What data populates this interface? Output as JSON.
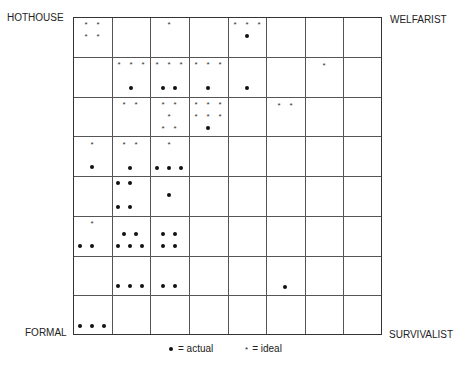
{
  "corners": {
    "top_left": "HOTHOUSE",
    "top_right": "WELFARIST",
    "bottom_left": "FORMAL",
    "bottom_right": "SURVIVALIST"
  },
  "legend": {
    "actual_symbol": "•",
    "actual_label": "= actual",
    "ideal_symbol": "*",
    "ideal_label": "= ideal"
  },
  "grid": {
    "rows": 8,
    "cols": 8,
    "cells": [
      {
        "row": 0,
        "col": 0,
        "ideal": 4,
        "actual": 0
      },
      {
        "row": 0,
        "col": 2,
        "ideal": 1,
        "actual": 0
      },
      {
        "row": 0,
        "col": 4,
        "ideal": 3,
        "actual": 1
      },
      {
        "row": 1,
        "col": 1,
        "ideal": 3,
        "actual": 1
      },
      {
        "row": 1,
        "col": 2,
        "ideal": 3,
        "actual": 2
      },
      {
        "row": 1,
        "col": 3,
        "ideal": 3,
        "actual": 0
      },
      {
        "row": 1,
        "col": 4,
        "ideal": 0,
        "actual": 1
      },
      {
        "row": 1,
        "col": 6,
        "ideal": 1,
        "actual": 0
      },
      {
        "row": 2,
        "col": 1,
        "ideal": 2,
        "actual": 0
      },
      {
        "row": 2,
        "col": 2,
        "ideal": 5,
        "actual": 0
      },
      {
        "row": 2,
        "col": 3,
        "ideal": 6,
        "actual": 1
      },
      {
        "row": 2,
        "col": 5,
        "ideal": 2,
        "actual": 0
      },
      {
        "row": 3,
        "col": 0,
        "ideal": 1,
        "actual": 1
      },
      {
        "row": 3,
        "col": 1,
        "ideal": 2,
        "actual": 1
      },
      {
        "row": 3,
        "col": 2,
        "ideal": 1,
        "actual": 3
      },
      {
        "row": 4,
        "col": 1,
        "ideal": 0,
        "actual": 4
      },
      {
        "row": 4,
        "col": 2,
        "ideal": 0,
        "actual": 1
      },
      {
        "row": 5,
        "col": 0,
        "ideal": 1,
        "actual": 2
      },
      {
        "row": 5,
        "col": 1,
        "ideal": 0,
        "actual": 5
      },
      {
        "row": 5,
        "col": 2,
        "ideal": 0,
        "actual": 4
      },
      {
        "row": 6,
        "col": 1,
        "ideal": 0,
        "actual": 3
      },
      {
        "row": 6,
        "col": 2,
        "ideal": 0,
        "actual": 2
      },
      {
        "row": 6,
        "col": 5,
        "ideal": 0,
        "actual": 1
      },
      {
        "row": 7,
        "col": 0,
        "ideal": 0,
        "actual": 3
      }
    ]
  },
  "marks": [
    {
      "t": "star",
      "x": 86,
      "y": 23
    },
    {
      "t": "star",
      "x": 98,
      "y": 23
    },
    {
      "t": "star",
      "x": 86,
      "y": 35
    },
    {
      "t": "star",
      "x": 98,
      "y": 35
    },
    {
      "t": "star",
      "x": 169,
      "y": 23
    },
    {
      "t": "star",
      "x": 235,
      "y": 23
    },
    {
      "t": "star",
      "x": 247,
      "y": 23
    },
    {
      "t": "star",
      "x": 259,
      "y": 23
    },
    {
      "t": "dot",
      "x": 247,
      "y": 36
    },
    {
      "t": "star",
      "x": 119,
      "y": 63
    },
    {
      "t": "star",
      "x": 131,
      "y": 63
    },
    {
      "t": "star",
      "x": 143,
      "y": 63
    },
    {
      "t": "dot",
      "x": 131,
      "y": 88
    },
    {
      "t": "star",
      "x": 157,
      "y": 63
    },
    {
      "t": "star",
      "x": 169,
      "y": 63
    },
    {
      "t": "star",
      "x": 181,
      "y": 63
    },
    {
      "t": "dot",
      "x": 163,
      "y": 88
    },
    {
      "t": "dot",
      "x": 175,
      "y": 88
    },
    {
      "t": "star",
      "x": 196,
      "y": 63
    },
    {
      "t": "star",
      "x": 208,
      "y": 63
    },
    {
      "t": "star",
      "x": 220,
      "y": 63
    },
    {
      "t": "dot",
      "x": 208,
      "y": 88
    },
    {
      "t": "dot",
      "x": 247,
      "y": 88
    },
    {
      "t": "star",
      "x": 324,
      "y": 64
    },
    {
      "t": "star",
      "x": 124,
      "y": 103
    },
    {
      "t": "star",
      "x": 136,
      "y": 103
    },
    {
      "t": "star",
      "x": 163,
      "y": 103
    },
    {
      "t": "star",
      "x": 175,
      "y": 103
    },
    {
      "t": "star",
      "x": 169,
      "y": 115
    },
    {
      "t": "star",
      "x": 163,
      "y": 127
    },
    {
      "t": "star",
      "x": 175,
      "y": 127
    },
    {
      "t": "star",
      "x": 196,
      "y": 103
    },
    {
      "t": "star",
      "x": 208,
      "y": 103
    },
    {
      "t": "star",
      "x": 220,
      "y": 103
    },
    {
      "t": "star",
      "x": 196,
      "y": 115
    },
    {
      "t": "star",
      "x": 208,
      "y": 115
    },
    {
      "t": "star",
      "x": 220,
      "y": 115
    },
    {
      "t": "dot",
      "x": 208,
      "y": 128
    },
    {
      "t": "star",
      "x": 279,
      "y": 104
    },
    {
      "t": "star",
      "x": 291,
      "y": 104
    },
    {
      "t": "star",
      "x": 92,
      "y": 143
    },
    {
      "t": "dot",
      "x": 92,
      "y": 167
    },
    {
      "t": "star",
      "x": 124,
      "y": 143
    },
    {
      "t": "star",
      "x": 136,
      "y": 143
    },
    {
      "t": "dot",
      "x": 130,
      "y": 168
    },
    {
      "t": "star",
      "x": 169,
      "y": 143
    },
    {
      "t": "dot",
      "x": 157,
      "y": 168
    },
    {
      "t": "dot",
      "x": 169,
      "y": 168
    },
    {
      "t": "dot",
      "x": 181,
      "y": 168
    },
    {
      "t": "dot",
      "x": 118,
      "y": 183
    },
    {
      "t": "dot",
      "x": 130,
      "y": 183
    },
    {
      "t": "dot",
      "x": 118,
      "y": 207
    },
    {
      "t": "dot",
      "x": 130,
      "y": 207
    },
    {
      "t": "dot",
      "x": 169,
      "y": 195
    },
    {
      "t": "star",
      "x": 92,
      "y": 222
    },
    {
      "t": "dot",
      "x": 80,
      "y": 246
    },
    {
      "t": "dot",
      "x": 92,
      "y": 246
    },
    {
      "t": "dot",
      "x": 124,
      "y": 234
    },
    {
      "t": "dot",
      "x": 136,
      "y": 234
    },
    {
      "t": "dot",
      "x": 118,
      "y": 246
    },
    {
      "t": "dot",
      "x": 130,
      "y": 246
    },
    {
      "t": "dot",
      "x": 142,
      "y": 246
    },
    {
      "t": "dot",
      "x": 163,
      "y": 234
    },
    {
      "t": "dot",
      "x": 175,
      "y": 234
    },
    {
      "t": "dot",
      "x": 163,
      "y": 246
    },
    {
      "t": "dot",
      "x": 175,
      "y": 246
    },
    {
      "t": "dot",
      "x": 118,
      "y": 286
    },
    {
      "t": "dot",
      "x": 130,
      "y": 286
    },
    {
      "t": "dot",
      "x": 142,
      "y": 286
    },
    {
      "t": "dot",
      "x": 163,
      "y": 286
    },
    {
      "t": "dot",
      "x": 175,
      "y": 286
    },
    {
      "t": "dot",
      "x": 285,
      "y": 287
    },
    {
      "t": "dot",
      "x": 80,
      "y": 326
    },
    {
      "t": "dot",
      "x": 92,
      "y": 326
    },
    {
      "t": "dot",
      "x": 104,
      "y": 326
    }
  ]
}
